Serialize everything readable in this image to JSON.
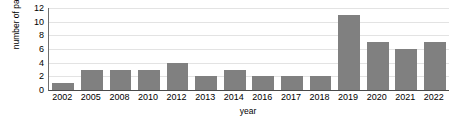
{
  "chart_data": {
    "type": "bar",
    "title": "",
    "xlabel": "year",
    "ylabel": "number of papers",
    "categories": [
      "2002",
      "2005",
      "2008",
      "2010",
      "2012",
      "2013",
      "2014",
      "2016",
      "2017",
      "2018",
      "2019",
      "2020",
      "2021",
      "2022"
    ],
    "values": [
      1,
      3,
      3,
      3,
      4,
      2,
      3,
      2,
      2,
      2,
      11,
      7,
      6,
      7
    ],
    "series": [
      {
        "name": "number of papers",
        "values": [
          1,
          3,
          3,
          3,
          4,
          2,
          3,
          2,
          2,
          2,
          11,
          7,
          6,
          7
        ]
      }
    ],
    "ylim": [
      0,
      12
    ],
    "yticks": [
      0,
      2,
      4,
      6,
      8,
      10,
      12
    ],
    "ytick_labels": [
      "0",
      "2",
      "4",
      "6",
      "8",
      "10",
      "12"
    ],
    "grid": "horizontal",
    "legend": "none",
    "bar_color": "#808080",
    "grid_color": "#e3e3e3",
    "axis_color": "#4a4a4a",
    "background_color": "#ffffff"
  }
}
